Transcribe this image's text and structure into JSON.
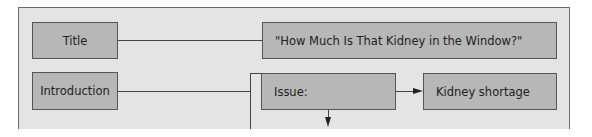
{
  "diagram": {
    "rows": [
      {
        "label": "Title",
        "content": "\"How Much Is That Kidney in the Window?\""
      },
      {
        "label": "Introduction",
        "issue": "Issue:",
        "issue_target": "Kidney shortage"
      }
    ]
  }
}
